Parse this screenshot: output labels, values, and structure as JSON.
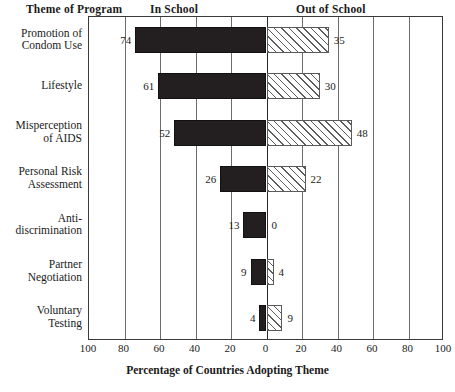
{
  "header": {
    "theme_col": "Theme of Program",
    "in_school": "In School",
    "out_of_school": "Out of School"
  },
  "axis": {
    "title": "Percentage of Countries Adopting Theme",
    "ticks": [
      "100",
      "80",
      "60",
      "40",
      "20",
      "0",
      "20",
      "40",
      "60",
      "80",
      "100"
    ]
  },
  "chart_data": {
    "type": "bar",
    "orientation": "horizontal",
    "layout": "diverging-bidirectional",
    "title": "",
    "xlabel": "Percentage of Countries Adopting Theme",
    "ylabel": "Theme of Program",
    "xlim": [
      -100,
      100
    ],
    "xticks": [
      -100,
      -80,
      -60,
      -40,
      -20,
      0,
      20,
      40,
      60,
      80,
      100
    ],
    "xticklabels": [
      "100",
      "80",
      "60",
      "40",
      "20",
      "0",
      "20",
      "40",
      "60",
      "80",
      "100"
    ],
    "grid": true,
    "legend": "none",
    "series": [
      {
        "name": "In School",
        "direction": "left",
        "fill": "solid-black",
        "values": [
          74,
          61,
          52,
          26,
          13,
          9,
          4
        ]
      },
      {
        "name": "Out of School",
        "direction": "right",
        "fill": "diagonal-hatch",
        "values": [
          35,
          30,
          48,
          22,
          0,
          4,
          9
        ]
      }
    ],
    "categories": [
      "Promotion of Condom Use",
      "Lifestyle",
      "Misperception of AIDS",
      "Personal Risk Assessment",
      "Anti-discrimination",
      "Partner Negotiation",
      "Voluntary Testing"
    ]
  },
  "rows": [
    {
      "label_lines": [
        "Promotion of",
        "Condom Use"
      ],
      "left_value": "74",
      "right_value": "35"
    },
    {
      "label_lines": [
        "Lifestyle"
      ],
      "left_value": "61",
      "right_value": "30"
    },
    {
      "label_lines": [
        "Misperception",
        "of AIDS"
      ],
      "left_value": "52",
      "right_value": "48"
    },
    {
      "label_lines": [
        "Personal Risk",
        "Assessment"
      ],
      "left_value": "26",
      "right_value": "22"
    },
    {
      "label_lines": [
        "Anti-",
        "discrimination"
      ],
      "left_value": "13",
      "right_value": "0"
    },
    {
      "label_lines": [
        "Partner",
        "Negotiation"
      ],
      "left_value": "9",
      "right_value": "4"
    },
    {
      "label_lines": [
        "Voluntary",
        "Testing"
      ],
      "left_value": "4",
      "right_value": "9"
    }
  ],
  "colors": {
    "in_school_bar": "#231f20",
    "out_of_school_hatch": "#5c5c5c",
    "frame": "#3a3a3a",
    "gridline": "#6c6c6c",
    "text": "#1a1a1a",
    "background": "#ffffff"
  }
}
